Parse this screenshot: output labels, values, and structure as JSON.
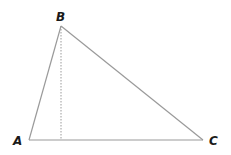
{
  "diagram": {
    "type": "triangle-with-altitude",
    "vertices": [
      {
        "id": "A",
        "label": "A",
        "x": 29,
        "y": 140
      },
      {
        "id": "B",
        "label": "B",
        "x": 61,
        "y": 26
      },
      {
        "id": "C",
        "label": "C",
        "x": 203,
        "y": 140
      }
    ],
    "altitude": {
      "from": "B",
      "foot_x": 61,
      "foot_y": 140,
      "style": "dotted"
    },
    "colors": {
      "edge": "#9a9a9a",
      "altitude": "#9a9a9a",
      "label": "#1a1a1a"
    }
  }
}
